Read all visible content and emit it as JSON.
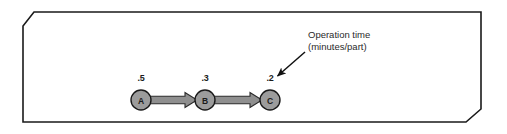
{
  "figure": {
    "name": "process-flow-diagram",
    "frame": {
      "shape": "chamfered-rectangle",
      "stroke_color": "#1a1a1a",
      "fill_color": "#ffffff",
      "stroke_width": 1.4,
      "chamfer_corners": "top-left, bottom-right"
    },
    "nodes": [
      {
        "id": "A",
        "label": "A",
        "time_label": ".5",
        "cx": 141,
        "cy": 100,
        "r": 10
      },
      {
        "id": "B",
        "label": "B",
        "time_label": ".3",
        "cx": 205,
        "cy": 100,
        "r": 10
      },
      {
        "id": "C",
        "label": "C",
        "time_label": ".2",
        "cx": 270,
        "cy": 100,
        "r": 10
      }
    ],
    "connectors": [
      {
        "from": "A",
        "to": "B",
        "style": "thick-block-arrow"
      },
      {
        "from": "B",
        "to": "C",
        "style": "thick-block-arrow"
      }
    ],
    "callout": {
      "line1": "Operation time",
      "line2": "(minutes/part)",
      "points_to": "C"
    },
    "colors": {
      "node_fill": "#9c9c9c",
      "node_stroke": "#1a1a1a",
      "arrow_fill": "#8f8f8f",
      "arrow_stroke": "#2b2b2b",
      "text": "#1b1b1b",
      "callout_text": "#2a2a2a",
      "callout_arrow": "#111111",
      "frame_stroke": "#1a1a1a",
      "background": "#ffffff"
    }
  }
}
